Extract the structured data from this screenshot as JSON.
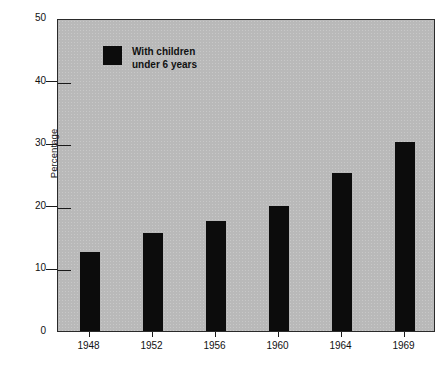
{
  "chart_data": {
    "type": "bar",
    "title": "",
    "xlabel": "",
    "ylabel": "Percentage",
    "categories": [
      "1948",
      "1952",
      "1956",
      "1960",
      "1964",
      "1969"
    ],
    "values": [
      12.6,
      15.7,
      17.6,
      20.0,
      25.2,
      30.2
    ],
    "series": [
      {
        "name": "With children under 6 years",
        "values": [
          12.6,
          15.7,
          17.6,
          20.0,
          25.2,
          30.2
        ]
      }
    ],
    "ylim": [
      0,
      50
    ],
    "ytick_labels": [
      "0",
      "10",
      "20",
      "30",
      "40",
      "50"
    ],
    "ytick_values": [
      0,
      10,
      20,
      30,
      40,
      50
    ],
    "grid": false,
    "legend_position": "inside-upper-left",
    "legend": [
      {
        "label_line1": "With children",
        "label_line2": "under 6 years",
        "color": "#0c0c0c"
      }
    ],
    "colors": {
      "bar": "#0c0c0c",
      "plot_background": "#b9b9b9",
      "figure_background": "#ffffff",
      "axis": "#1a1a1a",
      "text": "#111111"
    }
  }
}
